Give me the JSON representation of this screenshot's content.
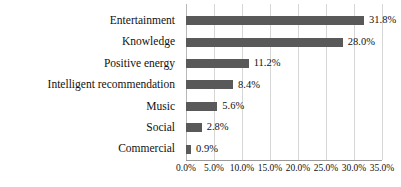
{
  "chart_data": {
    "type": "bar",
    "orientation": "horizontal",
    "title": "",
    "xlabel": "",
    "ylabel": "",
    "categories": [
      "Entertainment",
      "Knowledge",
      "Positive energy",
      "Intelligent recommendation",
      "Music",
      "Social",
      "Commercial"
    ],
    "values": [
      31.8,
      28.0,
      11.2,
      8.4,
      5.6,
      2.8,
      0.9
    ],
    "value_labels": [
      "31.8%",
      "28.0%",
      "11.2%",
      "8.4%",
      "5.6%",
      "2.8%",
      "0.9%"
    ],
    "xlim": [
      0,
      35
    ],
    "xticks": [
      0,
      5,
      10,
      15,
      20,
      25,
      30,
      35
    ],
    "xtick_labels": [
      "0.0%",
      "5.0%",
      "10.0%",
      "15.0%",
      "20.0%",
      "25.0%",
      "30.0%",
      "35.0%"
    ],
    "grid": true,
    "grid_axis": "x",
    "legend": false,
    "series": [
      {
        "name": "",
        "values": [
          31.8,
          28.0,
          11.2,
          8.4,
          5.6,
          2.8,
          0.9
        ]
      }
    ]
  },
  "colors": {
    "bar": "#595959",
    "gridline": "#d6d6d6",
    "axis_line": "#9a9a9a",
    "background": "#ffffff",
    "text": "#111111"
  }
}
